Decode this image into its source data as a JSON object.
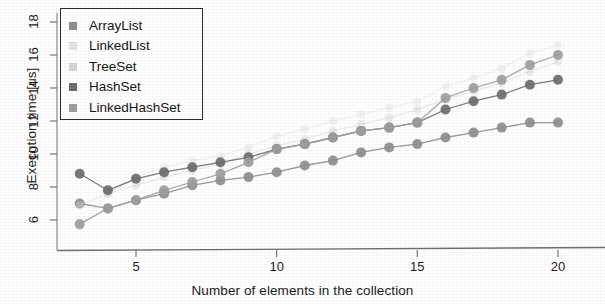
{
  "chart_data": {
    "type": "line",
    "title": "",
    "xlabel": "Number of elements in the collection",
    "ylabel": "Execution time [us]",
    "xlim": [
      2.6,
      20.6
    ],
    "ylim": [
      5.2,
      18.9
    ],
    "xticks": [
      5,
      10,
      15,
      20
    ],
    "yticks": [
      6,
      8,
      10,
      12,
      14,
      16,
      18
    ],
    "grid": false,
    "legend_position": "top-left",
    "x": [
      3,
      4,
      5,
      6,
      7,
      8,
      9,
      10,
      11,
      12,
      13,
      14,
      15,
      16,
      17,
      18,
      19,
      20
    ],
    "series": [
      {
        "name": "ArrayList",
        "color": "#8f8f8f",
        "values": [
          7.0,
          6.7,
          7.2,
          7.6,
          8.1,
          8.4,
          8.6,
          8.9,
          9.3,
          9.6,
          10.1,
          10.4,
          10.6,
          11.0,
          11.3,
          11.6,
          11.9,
          11.9
        ]
      },
      {
        "name": "LinkedList",
        "color": "#e2e2e2",
        "values": [
          5.6,
          7.6,
          8.6,
          9.2,
          9.6,
          9.9,
          10.4,
          11.1,
          11.5,
          12.0,
          12.4,
          12.8,
          13.2,
          14.1,
          14.6,
          15.2,
          16.1,
          16.6
        ]
      },
      {
        "name": "TreeSet",
        "color": "#d2d2d2",
        "values": [
          6.9,
          7.6,
          8.1,
          8.6,
          9.0,
          9.4,
          10.0,
          10.5,
          10.9,
          11.4,
          11.8,
          12.2,
          12.7,
          13.3,
          13.8,
          14.3,
          15.0,
          15.6
        ]
      },
      {
        "name": "HashSet",
        "color": "#6e6e6e",
        "values": [
          8.8,
          7.8,
          8.5,
          8.9,
          9.2,
          9.5,
          9.8,
          10.3,
          10.6,
          11.0,
          11.4,
          11.6,
          11.9,
          12.7,
          13.2,
          13.6,
          14.2,
          14.5
        ]
      },
      {
        "name": "LinkedHashSet",
        "color": "#a0a0a0",
        "values": [
          5.75,
          6.7,
          7.2,
          7.8,
          8.3,
          8.8,
          9.5,
          10.3,
          10.6,
          11.0,
          11.4,
          11.6,
          11.9,
          13.4,
          14.0,
          14.5,
          15.4,
          16.0
        ]
      }
    ]
  },
  "axes": {
    "x_tick_labels": [
      "5",
      "10",
      "15",
      "20"
    ],
    "y_tick_labels": [
      "6",
      "8",
      "10",
      "12",
      "14",
      "16",
      "18"
    ],
    "x_axis_title": "Number of elements in the collection",
    "y_axis_title": "Execution time [us]"
  },
  "legend": {
    "entries": [
      {
        "label": "ArrayList",
        "swatch": "#8f8f8f"
      },
      {
        "label": "LinkedList",
        "swatch": "#e4e4e4"
      },
      {
        "label": "TreeSet",
        "swatch": "#d6d6d6"
      },
      {
        "label": "HashSet",
        "swatch": "#6e6e6e"
      },
      {
        "label": "LinkedHashSet",
        "swatch": "#a0a0a0"
      }
    ]
  }
}
